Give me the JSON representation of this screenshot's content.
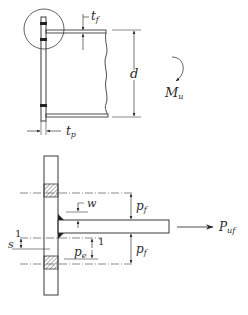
{
  "figure": {
    "colors": {
      "ink": "#2a2a2a",
      "hatch": "#555555",
      "background": "#ffffff"
    }
  },
  "top_view": {
    "labels": {
      "flange_thickness": "t",
      "flange_thickness_sub": "f",
      "beam_depth": "d",
      "moment": "M",
      "moment_sub": "u",
      "plate_thickness": "t",
      "plate_thickness_sub": "p"
    }
  },
  "bottom_view": {
    "labels": {
      "weld_size": "w",
      "pitch_top": "p",
      "pitch_top_sub": "f",
      "pitch_bottom": "p",
      "pitch_bottom_sub": "f",
      "pitch_e": "p",
      "pitch_e_sub": "e",
      "gap_s": "s",
      "one_left": "1",
      "one_right": "1",
      "force": "P",
      "force_sub": "uf"
    }
  }
}
